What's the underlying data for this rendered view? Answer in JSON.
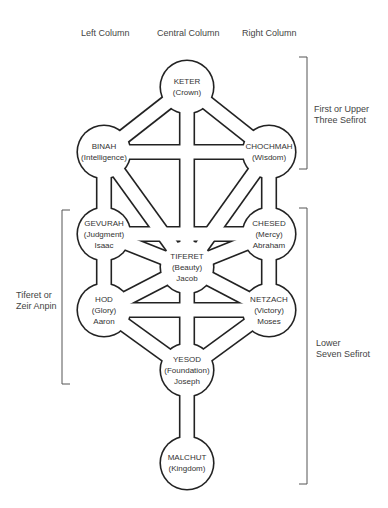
{
  "columns": {
    "left": "Left Column",
    "central": "Central Column",
    "right": "Right Column"
  },
  "groups": {
    "upper": [
      "First or Upper",
      "Three Sefirot"
    ],
    "lower": [
      "Lower",
      "Seven Sefirot"
    ],
    "tiferet": [
      "Tiferet or",
      "Zeir Anpin"
    ]
  },
  "sefirot": [
    {
      "id": "keter",
      "name": "KETER",
      "meaning": "(Crown)",
      "figure": ""
    },
    {
      "id": "binah",
      "name": "BINAH",
      "meaning": "(Intelligence)",
      "figure": ""
    },
    {
      "id": "chochmah",
      "name": "CHOCHMAH",
      "meaning": "(Wisdom)",
      "figure": ""
    },
    {
      "id": "gevurah",
      "name": "GEVURAH",
      "meaning": "(Judgment)",
      "figure": "Isaac"
    },
    {
      "id": "chesed",
      "name": "CHESED",
      "meaning": "(Mercy)",
      "figure": "Abraham"
    },
    {
      "id": "tiferet",
      "name": "TIFERET",
      "meaning": "(Beauty)",
      "figure": "Jacob"
    },
    {
      "id": "hod",
      "name": "HOD",
      "meaning": "(Glory)",
      "figure": "Aaron"
    },
    {
      "id": "netzach",
      "name": "NETZACH",
      "meaning": "(Victory)",
      "figure": "Moses"
    },
    {
      "id": "yesod",
      "name": "YESOD",
      "meaning": "(Foundation)",
      "figure": "Joseph"
    },
    {
      "id": "malchut",
      "name": "MALCHUT",
      "meaning": "(Kingdom)",
      "figure": ""
    }
  ],
  "paths": [
    [
      "keter",
      "binah"
    ],
    [
      "keter",
      "chochmah"
    ],
    [
      "keter",
      "tiferet"
    ],
    [
      "binah",
      "chochmah"
    ],
    [
      "binah",
      "gevurah"
    ],
    [
      "binah",
      "tiferet"
    ],
    [
      "chochmah",
      "chesed"
    ],
    [
      "chochmah",
      "tiferet"
    ],
    [
      "gevurah",
      "chesed"
    ],
    [
      "gevurah",
      "tiferet"
    ],
    [
      "gevurah",
      "hod"
    ],
    [
      "chesed",
      "tiferet"
    ],
    [
      "chesed",
      "netzach"
    ],
    [
      "tiferet",
      "hod"
    ],
    [
      "tiferet",
      "netzach"
    ],
    [
      "tiferet",
      "yesod"
    ],
    [
      "hod",
      "netzach"
    ],
    [
      "hod",
      "yesod"
    ],
    [
      "netzach",
      "yesod"
    ],
    [
      "yesod",
      "malchut"
    ]
  ]
}
